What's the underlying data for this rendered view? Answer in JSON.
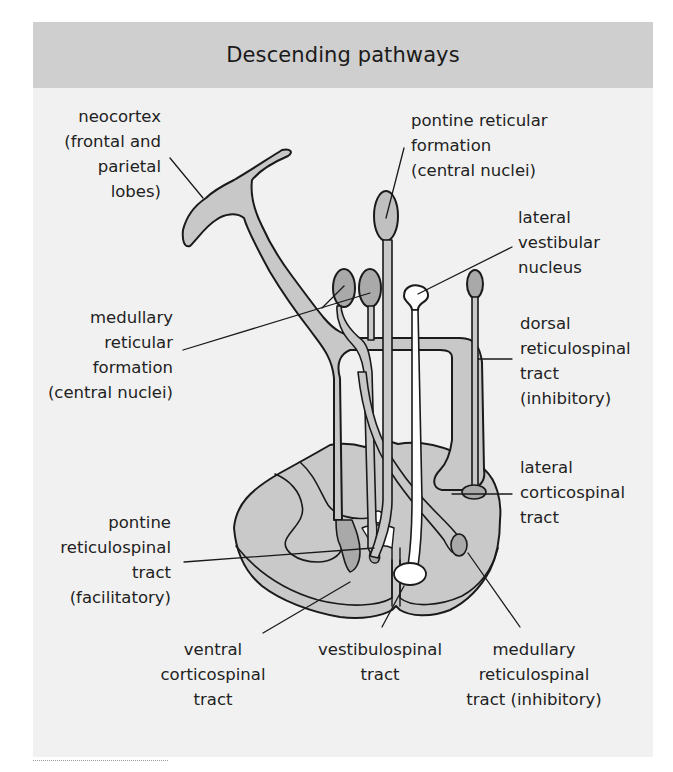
{
  "header": {
    "title": "Descending pathways"
  },
  "colors": {
    "header_bg": "#cfcfcf",
    "panel_bg": "#f1f1f1",
    "tract_fill": "#c8c8c8",
    "nucleus_fill": "#a9a9a9",
    "vestibular_fill": "#ffffff",
    "outline": "#1a1a1a"
  },
  "labels": {
    "neocortex": [
      "neocortex",
      "(frontal and",
      "parietal",
      "lobes)"
    ],
    "pontine_rf": [
      "pontine reticular",
      "formation",
      "(central nuclei)"
    ],
    "lateral_vestibular": [
      "lateral",
      "vestibular",
      "nucleus"
    ],
    "medullary_rf": [
      "medullary",
      "reticular",
      "formation",
      "(central nuclei)"
    ],
    "dorsal_rst": [
      "dorsal",
      "reticulospinal",
      "tract",
      "(inhibitory)"
    ],
    "lateral_cst": [
      "lateral",
      "corticospinal",
      "tract"
    ],
    "pontine_rst": [
      "pontine",
      "reticulospinal",
      "tract",
      "(facilitatory)"
    ],
    "ventral_cst": [
      "ventral",
      "corticospinal",
      "tract"
    ],
    "vestibulospinal": [
      "vestibulospinal",
      "tract"
    ],
    "medullary_rst": [
      "medullary",
      "reticulospinal",
      "tract (inhibitory)"
    ]
  }
}
